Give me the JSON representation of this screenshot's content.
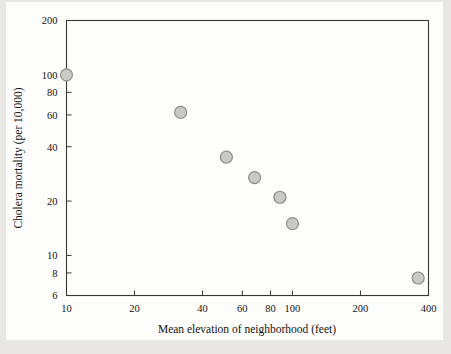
{
  "figure": {
    "background_color": "#e9e7e3",
    "paper_color": "#fdfdfc",
    "axis_color": "#3a3732",
    "marker_fill": "#c9c9c6",
    "marker_stroke": "#8c8c89"
  },
  "chart_data": {
    "type": "scatter",
    "title": "",
    "xlabel": "Mean elevation of neighborhood (feet)",
    "ylabel": "Cholera mortality (per 10,000)",
    "xscale": "log",
    "yscale": "log",
    "xlim": [
      10,
      400
    ],
    "ylim": [
      6,
      200
    ],
    "grid": false,
    "legend": null,
    "xticks": [
      10,
      20,
      40,
      60,
      80,
      100,
      200,
      400
    ],
    "xtick_labels": [
      "10",
      "20",
      "40",
      "60",
      "80",
      "100",
      "200",
      "400"
    ],
    "yticks": [
      6,
      8,
      10,
      20,
      40,
      60,
      80,
      100,
      200
    ],
    "ytick_labels": [
      "6",
      "8",
      "10",
      "20",
      "40",
      "60",
      "80",
      "100",
      "200"
    ],
    "x": [
      10,
      32,
      51,
      68,
      88,
      100,
      360
    ],
    "y": [
      100,
      62,
      35,
      27,
      21,
      15,
      7.5
    ],
    "points": [
      {
        "x": 10,
        "y": 100
      },
      {
        "x": 32,
        "y": 62
      },
      {
        "x": 51,
        "y": 35
      },
      {
        "x": 68,
        "y": 27
      },
      {
        "x": 88,
        "y": 21
      },
      {
        "x": 100,
        "y": 15
      },
      {
        "x": 360,
        "y": 7.5
      }
    ],
    "marker_radius_px": 6
  }
}
